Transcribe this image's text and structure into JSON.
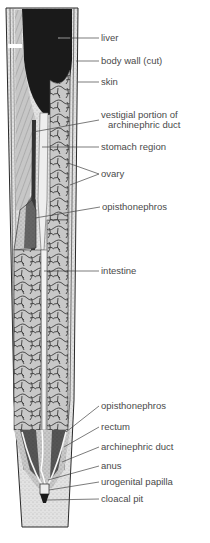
{
  "figure": {
    "colors": {
      "background": "#ffffff",
      "liver": "#1a1a1a",
      "tissue": "#b8b8b8",
      "outline": "#2a2a2a",
      "label_text": "#4a4a4a",
      "leader_line": "#444444"
    }
  },
  "labels": [
    {
      "id": "liver",
      "text": "liver",
      "x": 101,
      "y": 34
    },
    {
      "id": "body-wall",
      "text": "body wall (cut)",
      "x": 101,
      "y": 56
    },
    {
      "id": "skin",
      "text": "skin",
      "x": 101,
      "y": 78
    },
    {
      "id": "vestigial-duct",
      "text": "vestigial portion of",
      "text2": "archinephric duct",
      "x": 101,
      "y": 113
    },
    {
      "id": "stomach-region",
      "text": "stomach region",
      "x": 101,
      "y": 142
    },
    {
      "id": "ovary",
      "text": "ovary",
      "x": 101,
      "y": 169
    },
    {
      "id": "opisthonephros-upper",
      "text": "opisthonephros",
      "x": 102,
      "y": 202
    },
    {
      "id": "intestine",
      "text": "intestine",
      "x": 101,
      "y": 266
    },
    {
      "id": "opisthonephros-lower",
      "text": "opisthonephros",
      "x": 101,
      "y": 401
    },
    {
      "id": "rectum",
      "text": "rectum",
      "x": 101,
      "y": 423
    },
    {
      "id": "archinephric-duct",
      "text": "archinephric duct",
      "x": 101,
      "y": 442
    },
    {
      "id": "anus",
      "text": "anus",
      "x": 101,
      "y": 462
    },
    {
      "id": "urogenital-papilla",
      "text": "urogenital papilla",
      "x": 101,
      "y": 478
    },
    {
      "id": "cloacal-pit",
      "text": "cloacal pit",
      "x": 101,
      "y": 495
    }
  ]
}
